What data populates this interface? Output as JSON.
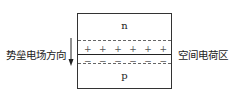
{
  "diagram": {
    "type": "pn-junction",
    "regions": {
      "top": "n",
      "bottom": "p"
    },
    "charges": {
      "positive": [
        "+",
        "+",
        "+",
        "+",
        "+",
        "+"
      ],
      "negative": [
        "−",
        "−",
        "−",
        "−",
        "−",
        "−"
      ]
    },
    "labels": {
      "left": "势垒电场方向",
      "right": "空间电荷区"
    },
    "colors": {
      "line": "#333333",
      "dashed": "#666666",
      "text": "#222222"
    }
  }
}
